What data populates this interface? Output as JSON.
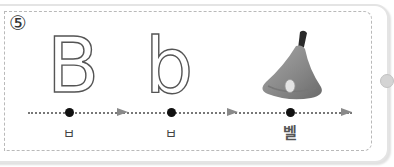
{
  "exercise": {
    "number": "⑤",
    "letters": {
      "uppercase": "B",
      "lowercase": "b"
    },
    "picture": {
      "icon": "bell-icon",
      "description": "hand bell"
    },
    "sequence": [
      {
        "label": "ㅂ",
        "x": 69
      },
      {
        "label": "ㅂ",
        "x": 171
      },
      {
        "label": "벨",
        "x": 290
      }
    ],
    "arrows": [
      122,
      232,
      346
    ],
    "colors": {
      "border": "#b9b9b9",
      "dot": "#111111",
      "arrow": "#8a8a8a",
      "bell_body": "#8c8c8c",
      "bell_handle": "#2a2a2a",
      "text": "#444444"
    }
  }
}
